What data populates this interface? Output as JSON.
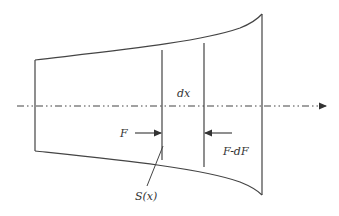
{
  "diagram": {
    "labels": {
      "dx": "dx",
      "force_left": "F",
      "force_right": "F-dF",
      "section_area": "S(x)"
    },
    "colors": {
      "stroke": "#444444",
      "background": "#ffffff"
    },
    "elements": [
      "tapered-body-outline",
      "centerline-axis-arrow",
      "section-line-left",
      "section-line-right",
      "force-arrow-F",
      "force-arrow-F-minus-dF",
      "section-leader-line"
    ]
  }
}
